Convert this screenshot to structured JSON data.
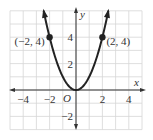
{
  "chart_data": {
    "type": "line",
    "title": "",
    "function": "y = x^2",
    "xlabel": "x",
    "ylabel": "y",
    "origin_label": "O",
    "xlim": [
      -5,
      5
    ],
    "ylim": [
      -3,
      6
    ],
    "grid": true,
    "x_ticks": [
      {
        "value": -4,
        "label": "−4"
      },
      {
        "value": -2,
        "label": "−2"
      },
      {
        "value": 2,
        "label": "2"
      },
      {
        "value": 4,
        "label": "4"
      }
    ],
    "y_ticks": [
      {
        "value": 4,
        "label": "4"
      },
      {
        "value": 2,
        "label": "2"
      },
      {
        "value": -2,
        "label": "−2"
      }
    ],
    "series": [
      {
        "name": "parabola",
        "x": [
          -2.4,
          -2,
          -1.5,
          -1,
          -0.5,
          0,
          0.5,
          1,
          1.5,
          2,
          2.4
        ],
        "y": [
          5.76,
          4,
          2.25,
          1,
          0.25,
          0,
          0.25,
          1,
          2.25,
          4,
          5.76
        ]
      }
    ],
    "points": [
      {
        "x": -2,
        "y": 4,
        "label": "(−2, 4)"
      },
      {
        "x": 2,
        "y": 4,
        "label": "(2, 4)"
      }
    ],
    "colors": {
      "grid": "#d6d6d6",
      "axis": "#333333",
      "curve": "#222222"
    }
  }
}
